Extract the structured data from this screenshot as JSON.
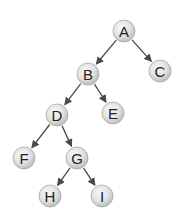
{
  "diagram": {
    "type": "binary-tree",
    "colors": {
      "background": "#ffffff",
      "node_fill_light": "#f4f4f4",
      "node_fill_dark": "#c4c4c4",
      "node_stroke": "#a8a8a8",
      "edge": "#4a4a4a",
      "label": "#222222"
    },
    "node_radius": 11,
    "nodes": [
      {
        "id": "A",
        "label": "A",
        "x": 124,
        "y": 31
      },
      {
        "id": "B",
        "label": "B",
        "x": 88,
        "y": 74
      },
      {
        "id": "C",
        "label": "C",
        "x": 160,
        "y": 71
      },
      {
        "id": "D",
        "label": "D",
        "x": 57,
        "y": 115
      },
      {
        "id": "E",
        "label": "E",
        "x": 113,
        "y": 113
      },
      {
        "id": "F",
        "label": "F",
        "x": 24,
        "y": 158
      },
      {
        "id": "G",
        "label": "G",
        "x": 77,
        "y": 158
      },
      {
        "id": "H",
        "label": "H",
        "x": 50,
        "y": 196
      },
      {
        "id": "I",
        "label": "I",
        "x": 102,
        "y": 196
      }
    ],
    "edges": [
      {
        "from": "A",
        "to": "B"
      },
      {
        "from": "A",
        "to": "C"
      },
      {
        "from": "B",
        "to": "D"
      },
      {
        "from": "B",
        "to": "E"
      },
      {
        "from": "D",
        "to": "F"
      },
      {
        "from": "D",
        "to": "G"
      },
      {
        "from": "G",
        "to": "H"
      },
      {
        "from": "G",
        "to": "I"
      }
    ]
  }
}
